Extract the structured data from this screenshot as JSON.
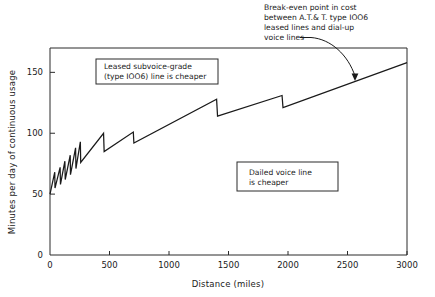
{
  "chart_data": {
    "type": "line",
    "title": "",
    "xlabel": "Distance  (miles)",
    "ylabel": "Minutes per day of continuous usage",
    "xlim": [
      0,
      3000
    ],
    "ylim": [
      0,
      170
    ],
    "grid": false,
    "legend_position": "none",
    "xticks": [
      0,
      500,
      1000,
      1500,
      2000,
      2500,
      3000
    ],
    "xticklabels": [
      "0",
      "500",
      "1000",
      "1500",
      "2000",
      "2500",
      "3000"
    ],
    "yticks": [
      0,
      50,
      100,
      150
    ],
    "yticklabels": [
      "0",
      "50",
      "100",
      "150"
    ],
    "series": [
      {
        "name": "Break-even minutes per day",
        "points": [
          [
            0,
            50
          ],
          [
            40,
            68
          ],
          [
            42,
            55
          ],
          [
            85,
            72
          ],
          [
            88,
            58
          ],
          [
            125,
            77
          ],
          [
            128,
            62
          ],
          [
            170,
            82
          ],
          [
            172,
            66
          ],
          [
            215,
            88
          ],
          [
            218,
            71
          ],
          [
            255,
            93
          ],
          [
            258,
            76
          ],
          [
            450,
            100
          ],
          [
            455,
            85
          ],
          [
            700,
            101
          ],
          [
            705,
            92
          ],
          [
            1400,
            128
          ],
          [
            1408,
            114
          ],
          [
            1950,
            131
          ],
          [
            1958,
            121
          ],
          [
            3000,
            158
          ]
        ]
      }
    ],
    "annotations": [
      {
        "id": "leased-region-note",
        "lines": [
          "Leased  subvoice-grade",
          "(type IOO6) line is cheaper"
        ],
        "boxed": true
      },
      {
        "id": "dialed-region-note",
        "lines": [
          "Dailed voice line",
          "is cheaper"
        ],
        "boxed": true
      },
      {
        "id": "breakeven-callout",
        "lines": [
          "Break-even point in cost",
          "between A.T.& T. type IOO6",
          "leased lines and dial-up",
          "voice lines"
        ],
        "boxed": false,
        "target_point": [
          2580,
          143
        ]
      }
    ]
  },
  "colors": {
    "line": "#1a1a1a",
    "axis": "#2b2b2b",
    "background": "#ffffff",
    "box_fill": "#ffffff"
  }
}
